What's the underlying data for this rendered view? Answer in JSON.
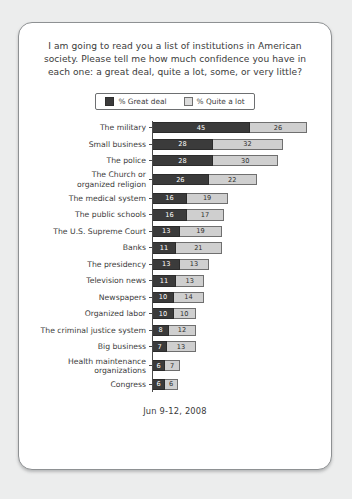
{
  "card": {
    "title": "I am going to read you a list of institutions in American society. Please tell me how much confidence you have in each one: a great deal, quite a lot, some, or very little?",
    "footer_date": "Jun 9-12, 2008"
  },
  "legend": {
    "items": [
      {
        "label": "% Great deal",
        "swatch": "dark-swatch",
        "color": "#3b3b3b"
      },
      {
        "label": "% Quite a lot",
        "swatch": "light-swatch",
        "color": "#cfcfcf"
      }
    ]
  },
  "chart_data": {
    "type": "bar",
    "orientation": "horizontal",
    "stacked": true,
    "title": "I am going to read you a list of institutions in American society. Please tell me how much confidence you have in each one: a great deal, quite a lot, some, or very little?",
    "xlabel": "",
    "ylabel": "",
    "xlim": [
      0,
      71
    ],
    "grid": false,
    "legend_position": "top-center",
    "annotation": "Jun 9-12, 2008",
    "categories": [
      "The military",
      "Small business",
      "The police",
      "The Church or\norganized religion",
      "The medical system",
      "The public schools",
      "The U.S. Supreme Court",
      "Banks",
      "The presidency",
      "Television news",
      "Newspapers",
      "Organized labor",
      "The criminal justice system",
      "Big business",
      "Health maintenance\norganizations",
      "Congress"
    ],
    "series": [
      {
        "name": "% Great deal",
        "color": "#3b3b3b",
        "values": [
          45,
          28,
          28,
          26,
          16,
          16,
          13,
          11,
          13,
          11,
          10,
          10,
          8,
          7,
          6,
          6
        ]
      },
      {
        "name": "% Quite a lot",
        "color": "#cfcfcf",
        "values": [
          26,
          32,
          30,
          22,
          19,
          17,
          19,
          21,
          13,
          13,
          14,
          10,
          12,
          13,
          7,
          6
        ]
      }
    ],
    "totals": [
      71,
      60,
      58,
      48,
      35,
      33,
      32,
      32,
      26,
      24,
      24,
      20,
      20,
      20,
      13,
      12
    ]
  }
}
